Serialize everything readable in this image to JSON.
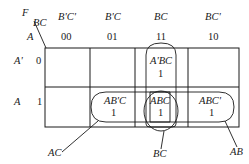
{
  "kmap": {
    "function_label": "F",
    "col_var_label": "BC",
    "row_var_label": "A",
    "columns": [
      {
        "term": "B'C'",
        "code": "00"
      },
      {
        "term": "B'C",
        "code": "01"
      },
      {
        "term": "BC",
        "code": "11"
      },
      {
        "term": "BC'",
        "code": "10"
      }
    ],
    "rows": [
      {
        "term": "A'",
        "code": "0"
      },
      {
        "term": "A",
        "code": "1"
      }
    ],
    "cells": [
      {
        "row": 0,
        "col": 2,
        "minterm": "A'BC",
        "value": "1"
      },
      {
        "row": 1,
        "col": 1,
        "minterm": "AB'C",
        "value": "1"
      },
      {
        "row": 1,
        "col": 2,
        "minterm": "ABC",
        "value": "1"
      },
      {
        "row": 1,
        "col": 3,
        "minterm": "ABC'",
        "value": "1"
      }
    ],
    "groups": [
      {
        "label": "AC",
        "cells": [
          "AB'C",
          "ABC"
        ]
      },
      {
        "label": "BC",
        "cells": [
          "A'BC",
          "ABC"
        ]
      },
      {
        "label": "AB",
        "cells": [
          "ABC",
          "ABC'"
        ]
      }
    ]
  }
}
